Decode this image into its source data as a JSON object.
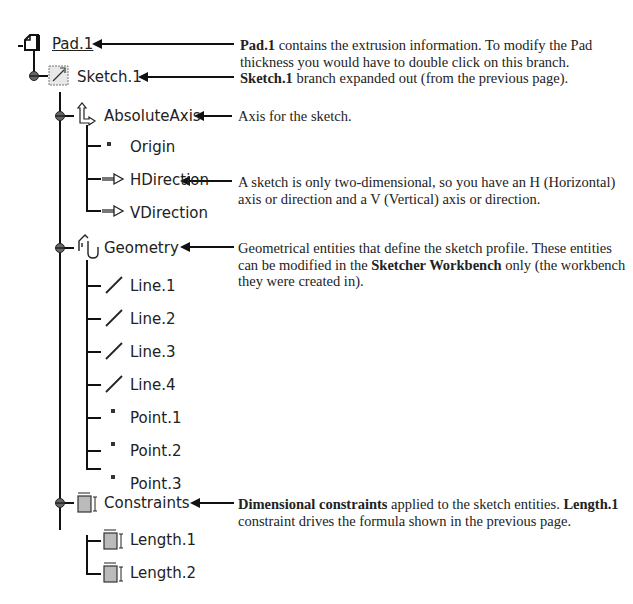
{
  "tree": {
    "root": {
      "label": "Pad.1",
      "icon": "pad-icon"
    },
    "sketch": {
      "label": "Sketch.1",
      "icon": "sketch-icon"
    },
    "absolute_axis": {
      "label": "AbsoluteAxis",
      "icon": "axis-icon",
      "children": [
        {
          "label": "Origin",
          "icon": "point-icon"
        },
        {
          "label": "HDirection",
          "icon": "direction-arrow-icon"
        },
        {
          "label": "VDirection",
          "icon": "direction-arrow-icon"
        }
      ]
    },
    "geometry": {
      "label": "Geometry",
      "icon": "geometry-icon",
      "children": [
        {
          "label": "Line.1",
          "icon": "line-icon"
        },
        {
          "label": "Line.2",
          "icon": "line-icon"
        },
        {
          "label": "Line.3",
          "icon": "line-icon"
        },
        {
          "label": "Line.4",
          "icon": "line-icon"
        },
        {
          "label": "Point.1",
          "icon": "point-icon"
        },
        {
          "label": "Point.2",
          "icon": "point-icon"
        },
        {
          "label": "Point.3",
          "icon": "point-icon"
        }
      ]
    },
    "constraints": {
      "label": "Constraints",
      "icon": "constraint-icon",
      "children": [
        {
          "label": "Length.1",
          "icon": "constraint-icon"
        },
        {
          "label": "Length.2",
          "icon": "constraint-icon"
        }
      ]
    }
  },
  "annotations": {
    "pad": {
      "bold": "Pad.1",
      "text": " contains the extrusion information.  To modify the Pad thickness you would have to double click on this branch."
    },
    "sketch": {
      "bold": "Sketch.1",
      "text": " branch expanded out (from the previous page)."
    },
    "axis": {
      "text": "Axis for the sketch."
    },
    "direction": {
      "text": "A sketch is only two-dimensional, so you have an H (Horizontal) axis or direction and a V (Vertical) axis or direction."
    },
    "geometry": {
      "text1": "Geometrical entities that define the sketch profile.  These entities can be modified in the ",
      "bold": "Sketcher Workbench",
      "text2": " only (the workbench they were created in)."
    },
    "constraints": {
      "bold1": "Dimensional constraints",
      "text1": " applied to the sketch entities.  ",
      "bold2": "Length.1",
      "text2": " constraint drives the formula shown in the previous page."
    }
  }
}
